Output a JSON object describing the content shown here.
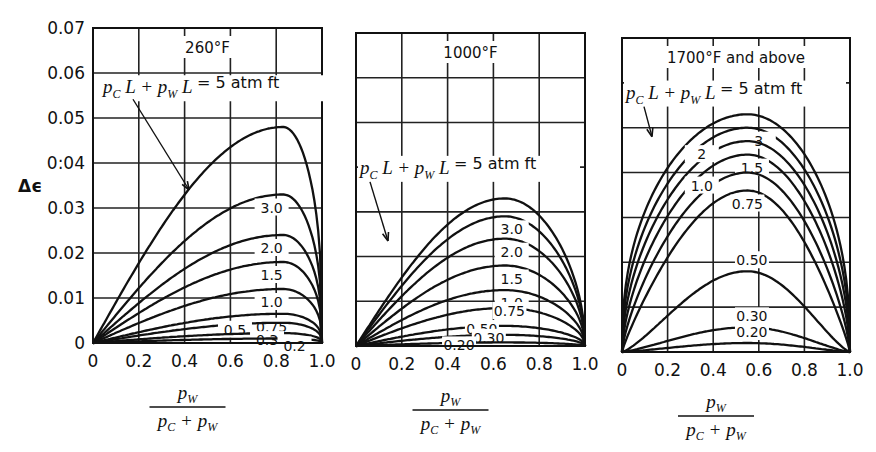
{
  "figure": {
    "ylabel": "Δϵ",
    "y_ticks": [
      "0",
      "0.01",
      "0.02",
      "0.03",
      "0:04",
      "0.05",
      "0.06",
      "0.07"
    ],
    "x_ticks": [
      "0",
      "0.2",
      "0.4",
      "0.6",
      "0.8",
      "1.0"
    ],
    "xlabel_numerator": "p_W",
    "xlabel_denominator": "p_C + p_W",
    "annotation_text": "p_C L + p_W L = 5 atm ft"
  },
  "chart_data": [
    {
      "type": "line",
      "title": "260°F",
      "xlabel": "p_W / (p_C + p_W)",
      "ylabel": "Δϵ",
      "xlim": [
        0,
        1.0
      ],
      "ylim": [
        0,
        0.07
      ],
      "grid": true,
      "x_peak": 0.83,
      "series": [
        {
          "name": "5 atm ft",
          "label": "p_C L + p_W L = 5 atm ft",
          "peak": 0.048
        },
        {
          "name": "3.0",
          "label": "3.0",
          "peak": 0.033
        },
        {
          "name": "2.0",
          "label": "2.0",
          "peak": 0.024
        },
        {
          "name": "1.5",
          "label": "1.5",
          "peak": 0.018
        },
        {
          "name": "1.0",
          "label": "1.0",
          "peak": 0.012
        },
        {
          "name": "0.75",
          "label": "0.75",
          "peak": 0.0065
        },
        {
          "name": "0.5",
          "label": "0.5",
          "peak": 0.0045
        },
        {
          "name": "0.3",
          "label": "0.3",
          "peak": 0.0022
        },
        {
          "name": "0.2",
          "label": "0.2",
          "peak": 0.001
        }
      ]
    },
    {
      "type": "line",
      "title": "1000°F",
      "xlabel": "p_W / (p_C + p_W)",
      "ylabel": "Δϵ",
      "xlim": [
        0,
        1.0
      ],
      "ylim": [
        0,
        0.07
      ],
      "grid": true,
      "x_peak": 0.65,
      "series": [
        {
          "name": "5 atm ft",
          "label": "p_C L + p_W L = 5 atm ft",
          "peak": 0.033
        },
        {
          "name": "3.0",
          "label": "3.0",
          "peak": 0.029
        },
        {
          "name": "2.0",
          "label": "2.0",
          "peak": 0.024
        },
        {
          "name": "1.5",
          "label": "1.5",
          "peak": 0.018
        },
        {
          "name": "1.0",
          "label": "1.0",
          "peak": 0.0125
        },
        {
          "name": "0.75",
          "label": "0.75",
          "peak": 0.0085
        },
        {
          "name": "0.50",
          "label": "0.50",
          "peak": 0.0045
        },
        {
          "name": "0.30",
          "label": "0.30",
          "peak": 0.0025
        },
        {
          "name": "0.20",
          "label": "0.20",
          "peak": 0.0008
        }
      ]
    },
    {
      "type": "line",
      "title": "1700°F and above",
      "xlabel": "p_W / (p_C + p_W)",
      "ylabel": "Δϵ",
      "xlim": [
        0,
        1.0
      ],
      "ylim": [
        0,
        0.07
      ],
      "grid": true,
      "x_peak": 0.55,
      "series": [
        {
          "name": "5 atm ft",
          "label": "p_C L + p_W L = 5 atm ft",
          "peak": 0.053
        },
        {
          "name": "3",
          "label": "3",
          "peak": 0.05
        },
        {
          "name": "2",
          "label": "2",
          "peak": 0.047
        },
        {
          "name": "1.5",
          "label": "1.5",
          "peak": 0.044
        },
        {
          "name": "1.0",
          "label": "1.0",
          "peak": 0.04
        },
        {
          "name": "0.75",
          "label": "0.75",
          "peak": 0.036
        },
        {
          "name": "0.50",
          "label": "0.50",
          "peak": 0.018
        },
        {
          "name": "0.30",
          "label": "0.30",
          "peak": 0.0055
        },
        {
          "name": "0.20",
          "label": "0.20",
          "peak": 0.002
        }
      ]
    }
  ]
}
